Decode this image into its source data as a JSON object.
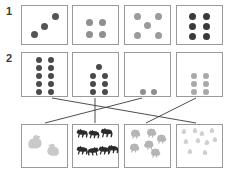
{
  "worksheet": {
    "title": "Counting and matching dot cards to animal groups",
    "background_color": "#ffffff",
    "border_color": "#9a9a9a",
    "width": 227,
    "height": 171
  },
  "row_labels": [
    {
      "id": "label-1",
      "text": "1",
      "x": 6,
      "y": 6
    },
    {
      "id": "label-2",
      "text": "2",
      "x": 6,
      "y": 53
    }
  ],
  "exercise_1": {
    "number": "1",
    "instruction_implied": "Count the dots on each card",
    "cards": [
      {
        "name": "dot-card-1-1",
        "count": 3,
        "arrangement": "diagonal",
        "dot_color": "#545454",
        "dot_size": 7,
        "box": {
          "x": 21,
          "y": 5,
          "w": 47,
          "h": 40
        },
        "dots": [
          {
            "x": 9,
            "y": 25
          },
          {
            "x": 19,
            "y": 17
          },
          {
            "x": 30,
            "y": 7
          }
        ]
      },
      {
        "name": "dot-card-1-2",
        "count": 4,
        "arrangement": "2x2-grid",
        "dot_color": "#8f8f8f",
        "dot_size": 7,
        "box": {
          "x": 72,
          "y": 5,
          "w": 47,
          "h": 40
        },
        "dots": [
          {
            "x": 13,
            "y": 13
          },
          {
            "x": 26,
            "y": 13
          },
          {
            "x": 13,
            "y": 25
          },
          {
            "x": 26,
            "y": 25
          }
        ]
      },
      {
        "name": "dot-card-1-3",
        "count": 5,
        "arrangement": "quincunx",
        "dot_color": "#9b9b9b",
        "dot_size": 7,
        "box": {
          "x": 124,
          "y": 5,
          "w": 47,
          "h": 40
        },
        "dots": [
          {
            "x": 9,
            "y": 7
          },
          {
            "x": 30,
            "y": 7
          },
          {
            "x": 19,
            "y": 16
          },
          {
            "x": 9,
            "y": 26
          },
          {
            "x": 30,
            "y": 26
          }
        ]
      },
      {
        "name": "dot-card-1-4",
        "count": 6,
        "arrangement": "2x3-grid",
        "dot_color": "#3a3a3a",
        "dot_size": 7,
        "box": {
          "x": 176,
          "y": 5,
          "w": 47,
          "h": 40
        },
        "dots": [
          {
            "x": 12,
            "y": 7
          },
          {
            "x": 26,
            "y": 7
          },
          {
            "x": 12,
            "y": 17
          },
          {
            "x": 26,
            "y": 17
          },
          {
            "x": 12,
            "y": 27
          },
          {
            "x": 26,
            "y": 27
          }
        ]
      }
    ]
  },
  "exercise_2": {
    "number": "2",
    "instruction_implied": "Draw a line to match each dot card with the group of animals",
    "dot_cards": [
      {
        "name": "dot-card-2-1",
        "count": 10,
        "arrangement": "2x5-grid",
        "dot_color": "#4a4a4a",
        "dot_size": 6,
        "box": {
          "x": 21,
          "y": 52,
          "w": 47,
          "h": 45
        },
        "dots": [
          {
            "x": 14,
            "y": 4
          },
          {
            "x": 26,
            "y": 4
          },
          {
            "x": 14,
            "y": 12
          },
          {
            "x": 26,
            "y": 12
          },
          {
            "x": 14,
            "y": 20
          },
          {
            "x": 26,
            "y": 20
          },
          {
            "x": 14,
            "y": 28
          },
          {
            "x": 26,
            "y": 28
          },
          {
            "x": 14,
            "y": 36
          },
          {
            "x": 26,
            "y": 36
          }
        ]
      },
      {
        "name": "dot-card-2-2",
        "count": 7,
        "arrangement": "1-over-2x3-grid",
        "dot_color": "#4a4a4a",
        "dot_size": 6,
        "box": {
          "x": 72,
          "y": 52,
          "w": 47,
          "h": 45
        },
        "dots": [
          {
            "x": 23,
            "y": 11
          },
          {
            "x": 17,
            "y": 20
          },
          {
            "x": 29,
            "y": 20
          },
          {
            "x": 17,
            "y": 28
          },
          {
            "x": 29,
            "y": 28
          },
          {
            "x": 17,
            "y": 36
          },
          {
            "x": 29,
            "y": 36
          }
        ]
      },
      {
        "name": "dot-card-2-3",
        "count": 2,
        "arrangement": "pair-bottom",
        "dot_color": "#8f8f8f",
        "dot_size": 6,
        "box": {
          "x": 124,
          "y": 52,
          "w": 47,
          "h": 45
        },
        "dots": [
          {
            "x": 15,
            "y": 36
          },
          {
            "x": 26,
            "y": 36
          }
        ]
      },
      {
        "name": "dot-card-2-4",
        "count": 6,
        "arrangement": "2x3-grid",
        "dot_color": "#a8a8a8",
        "dot_size": 6,
        "box": {
          "x": 176,
          "y": 52,
          "w": 47,
          "h": 45
        },
        "dots": [
          {
            "x": 14,
            "y": 20
          },
          {
            "x": 26,
            "y": 20
          },
          {
            "x": 14,
            "y": 28
          },
          {
            "x": 26,
            "y": 28
          },
          {
            "x": 14,
            "y": 36
          },
          {
            "x": 26,
            "y": 36
          }
        ]
      }
    ],
    "animal_cards": [
      {
        "name": "animal-card-chickens",
        "animal": "chicken",
        "count": 2,
        "tone": "#c9c9c9",
        "box": {
          "x": 21,
          "y": 124,
          "w": 47,
          "h": 44
        }
      },
      {
        "name": "animal-card-horses",
        "animal": "horse",
        "count": 7,
        "tone": "#2b2b2b",
        "box": {
          "x": 72,
          "y": 124,
          "w": 47,
          "h": 44
        }
      },
      {
        "name": "animal-card-sheep",
        "animal": "sheep",
        "count": 6,
        "tone": "#b5b5b5",
        "box": {
          "x": 124,
          "y": 124,
          "w": 47,
          "h": 44
        }
      },
      {
        "name": "animal-card-chicks",
        "animal": "chick",
        "count": 10,
        "tone": "#cfcfcf",
        "box": {
          "x": 176,
          "y": 124,
          "w": 47,
          "h": 44
        }
      }
    ],
    "matching_lines": [
      {
        "name": "match-line-10-to-chicks",
        "from_card": "dot-card-2-1",
        "to_card": "animal-card-chicks",
        "x1": 52,
        "y1": 98,
        "x2": 196,
        "y2": 123
      },
      {
        "name": "match-line-7-to-horses",
        "from_card": "dot-card-2-2",
        "to_card": "animal-card-horses",
        "x1": 95,
        "y1": 98,
        "x2": 95,
        "y2": 123
      },
      {
        "name": "match-line-2-to-chickens",
        "from_card": "dot-card-2-3",
        "to_card": "animal-card-chickens",
        "x1": 142,
        "y1": 98,
        "x2": 45,
        "y2": 123
      },
      {
        "name": "match-line-6-to-sheep",
        "from_card": "dot-card-2-4",
        "to_card": "animal-card-sheep",
        "x1": 196,
        "y1": 98,
        "x2": 146,
        "y2": 123
      }
    ],
    "line_color": "#3a3a3a"
  }
}
